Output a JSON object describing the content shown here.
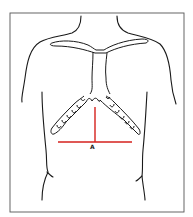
{
  "figure": {
    "type": "anatomical line drawing",
    "marker_label": "A",
    "colors": {
      "background": "#ffffff",
      "frame": "#555555",
      "outline": "#1a1a1a",
      "marker": "#d4201c"
    }
  }
}
